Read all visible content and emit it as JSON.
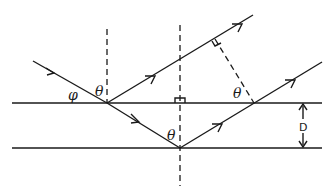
{
  "diagram": {
    "labels": {
      "phi": "φ",
      "theta_left": "θ",
      "theta_right": "θ",
      "theta_bottom": "θ",
      "spacing": "D"
    },
    "colors": {
      "ink": "#1a1a1a",
      "background": "#ffffff"
    },
    "elements": [
      "upper-plane-line",
      "lower-plane-line",
      "left-normal-dashed",
      "center-normal-dashed",
      "incident-ray",
      "refracted-ray",
      "reflected-ray-upper",
      "reflected-ray-lower",
      "path-difference-perpendicular",
      "spacing-arrow-D"
    ]
  }
}
